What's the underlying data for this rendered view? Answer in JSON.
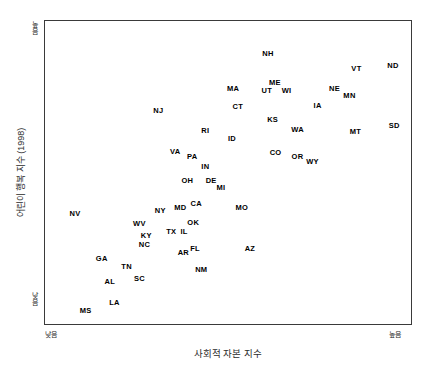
{
  "chart_data": {
    "type": "scatter",
    "title": "",
    "xlabel": "사회적 자본 지수",
    "ylabel": "어린이 행복 지수 (1998)",
    "xlim": [
      0,
      100
    ],
    "ylim": [
      0,
      100
    ],
    "grid": false,
    "legend": null,
    "x_tick_labels": [
      "낮음",
      "높음"
    ],
    "y_tick_labels": [
      "높음",
      "낮음"
    ],
    "point_label_style": "state-abbreviation",
    "points": [
      {
        "label": "NH",
        "x": 60.9,
        "y": 89.2
      },
      {
        "label": "VT",
        "x": 85.1,
        "y": 84.3
      },
      {
        "label": "ND",
        "x": 95.1,
        "y": 85.2
      },
      {
        "label": "ME",
        "x": 62.8,
        "y": 79.7
      },
      {
        "label": "UT",
        "x": 60.6,
        "y": 77.0
      },
      {
        "label": "WI",
        "x": 66.0,
        "y": 77.0
      },
      {
        "label": "NE",
        "x": 79.1,
        "y": 77.4
      },
      {
        "label": "MN",
        "x": 83.2,
        "y": 75.1
      },
      {
        "label": "MA",
        "x": 51.4,
        "y": 77.4
      },
      {
        "label": "IA",
        "x": 74.5,
        "y": 72.1
      },
      {
        "label": "CT",
        "x": 52.7,
        "y": 71.5
      },
      {
        "label": "NJ",
        "x": 31.0,
        "y": 70.2
      },
      {
        "label": "KS",
        "x": 62.2,
        "y": 67.2
      },
      {
        "label": "WA",
        "x": 69.0,
        "y": 63.9
      },
      {
        "label": "MT",
        "x": 84.8,
        "y": 63.3
      },
      {
        "label": "SD",
        "x": 95.4,
        "y": 65.2
      },
      {
        "label": "RI",
        "x": 43.8,
        "y": 63.6
      },
      {
        "label": "ID",
        "x": 51.1,
        "y": 61.0
      },
      {
        "label": "CO",
        "x": 63.0,
        "y": 56.4
      },
      {
        "label": "OR",
        "x": 69.0,
        "y": 55.1
      },
      {
        "label": "WY",
        "x": 73.1,
        "y": 53.4
      },
      {
        "label": "VA",
        "x": 35.6,
        "y": 56.7
      },
      {
        "label": "PA",
        "x": 40.2,
        "y": 55.1
      },
      {
        "label": "IN",
        "x": 43.8,
        "y": 51.8
      },
      {
        "label": "OH",
        "x": 38.9,
        "y": 47.2
      },
      {
        "label": "DE",
        "x": 45.4,
        "y": 47.2
      },
      {
        "label": "MI",
        "x": 48.1,
        "y": 44.9
      },
      {
        "label": "CA",
        "x": 41.3,
        "y": 39.7
      },
      {
        "label": "MD",
        "x": 37.0,
        "y": 38.4
      },
      {
        "label": "NY",
        "x": 31.5,
        "y": 37.4
      },
      {
        "label": "MO",
        "x": 53.8,
        "y": 38.4
      },
      {
        "label": "OK",
        "x": 40.5,
        "y": 33.4
      },
      {
        "label": "IL",
        "x": 38.0,
        "y": 30.5
      },
      {
        "label": "NV",
        "x": 8.2,
        "y": 36.4
      },
      {
        "label": "WV",
        "x": 25.8,
        "y": 33.1
      },
      {
        "label": "TX",
        "x": 34.5,
        "y": 30.5
      },
      {
        "label": "KY",
        "x": 27.7,
        "y": 29.2
      },
      {
        "label": "NC",
        "x": 27.2,
        "y": 26.2
      },
      {
        "label": "FL",
        "x": 41.0,
        "y": 24.9
      },
      {
        "label": "AR",
        "x": 37.8,
        "y": 23.3
      },
      {
        "label": "AZ",
        "x": 56.0,
        "y": 24.6
      },
      {
        "label": "GA",
        "x": 15.5,
        "y": 21.6
      },
      {
        "label": "TN",
        "x": 22.3,
        "y": 18.7
      },
      {
        "label": "SC",
        "x": 25.8,
        "y": 14.8
      },
      {
        "label": "AL",
        "x": 17.7,
        "y": 13.8
      },
      {
        "label": "NM",
        "x": 42.7,
        "y": 17.7
      },
      {
        "label": "MS",
        "x": 11.1,
        "y": 4.3
      },
      {
        "label": "LA",
        "x": 19.0,
        "y": 6.9
      }
    ]
  }
}
